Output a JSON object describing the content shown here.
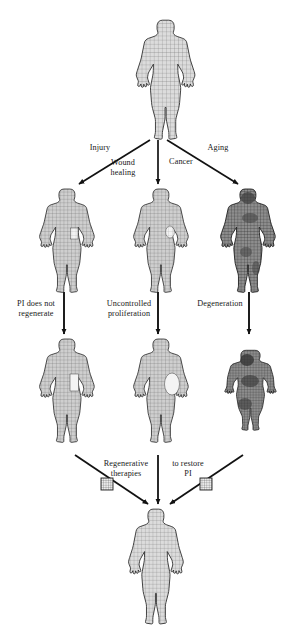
{
  "figure": {
    "background_color": "#ffffff",
    "line_color": "#111111",
    "mesh_color": "#555555",
    "body_fill_light": "#d8d8d8",
    "body_fill_mid": "#bdbdbd",
    "body_fill_dark": "#6f6f6f"
  },
  "labels": {
    "injury": "Injury",
    "wound_healing": "Wound\nhealing",
    "cancer": "Cancer",
    "aging": "Aging",
    "pi_does_not_regenerate": "PI does not\nregenerate",
    "uncontrolled_proliferation": "Uncontrolled\nproliferation",
    "degeneration": "Degeneration",
    "regenerative_therapies": "Regenerative\ntherapies",
    "to_restore_pi": "to restore\nPI"
  },
  "nodes": [
    {
      "id": "healthy-top",
      "row": 1,
      "label": "healthy body",
      "state": "healthy",
      "shade": "light"
    },
    {
      "id": "injured-body",
      "row": 2,
      "label": "injured body",
      "state": "injured",
      "shade": "light"
    },
    {
      "id": "cancer-body",
      "row": 2,
      "label": "cancer body",
      "state": "cancer",
      "shade": "light"
    },
    {
      "id": "aging-body",
      "row": 2,
      "label": "aging body",
      "state": "aging",
      "shade": "dark"
    },
    {
      "id": "non-regenerating-body",
      "row": 3,
      "label": "non-regenerating body",
      "state": "scarred",
      "shade": "light"
    },
    {
      "id": "proliferating-body",
      "row": 3,
      "label": "proliferating body",
      "state": "tumour",
      "shade": "light"
    },
    {
      "id": "degenerated-body",
      "row": 3,
      "label": "degenerated body",
      "state": "degenerated",
      "shade": "dark"
    },
    {
      "id": "restored-body",
      "row": 4,
      "label": "restored body",
      "state": "healthy",
      "shade": "light"
    }
  ],
  "icons": {
    "scaffold_left": "grid-scaffold-icon",
    "scaffold_right": "grid-scaffold-icon"
  },
  "edges": [
    {
      "from": "healthy-top",
      "to": "injured-body",
      "label": "Injury"
    },
    {
      "from": "healthy-top",
      "to": "cancer-body",
      "label": "Cancer"
    },
    {
      "from": "healthy-top",
      "to": "aging-body",
      "label": "Aging"
    },
    {
      "from": "injured-body",
      "to": "non-regenerating-body",
      "label": "PI does not regenerate"
    },
    {
      "from": "cancer-body",
      "to": "proliferating-body",
      "label": "Uncontrolled proliferation"
    },
    {
      "from": "aging-body",
      "to": "degenerated-body",
      "label": "Degeneration"
    },
    {
      "from": "non-regenerating-body",
      "to": "restored-body",
      "label": "Regenerative therapies"
    },
    {
      "from": "proliferating-body",
      "to": "restored-body",
      "label": "to restore PI"
    },
    {
      "from": "degenerated-body",
      "to": "restored-body",
      "label": ""
    }
  ]
}
